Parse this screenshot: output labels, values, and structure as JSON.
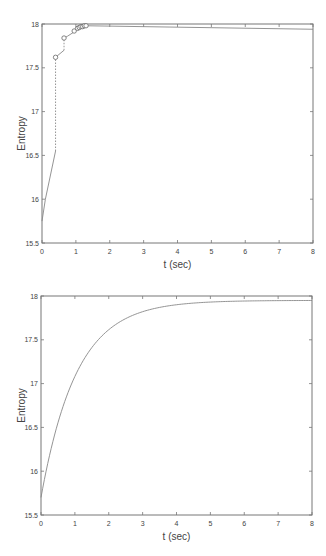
{
  "chart_data": [
    {
      "type": "line",
      "title": "",
      "xlabel": "t (sec)",
      "ylabel": "Entropy",
      "xlim": [
        0,
        8
      ],
      "ylim": [
        15.5,
        18
      ],
      "xticks": [
        "0",
        "1",
        "2",
        "3",
        "4",
        "5",
        "6",
        "7",
        "8"
      ],
      "yticks": [
        "15.5",
        "16",
        "16.5",
        "17",
        "17.5",
        "18"
      ],
      "grid": false,
      "series": [
        {
          "name": "discrete/step entropy trajectory",
          "x": [
            0,
            0.1,
            0.4,
            0.4,
            0.65,
            0.65,
            0.75,
            0.95,
            0.95,
            1.05,
            1.1,
            1.15,
            1.2,
            1.25,
            1.3,
            8
          ],
          "y": [
            15.75,
            16.0,
            16.55,
            17.62,
            17.7,
            17.84,
            17.86,
            17.91,
            17.92,
            17.95,
            17.96,
            17.97,
            17.97,
            17.98,
            17.98,
            17.94
          ],
          "markers_x": [
            0.4,
            0.65,
            0.95,
            1.05,
            1.1,
            1.15,
            1.2,
            1.25,
            1.3
          ],
          "markers_y": [
            17.62,
            17.84,
            17.92,
            17.95,
            17.96,
            17.97,
            17.97,
            17.98,
            17.98
          ],
          "marker": "circle"
        }
      ]
    },
    {
      "type": "line",
      "title": "",
      "xlabel": "t (sec)",
      "ylabel": "Entropy",
      "xlim": [
        0,
        8
      ],
      "ylim": [
        15.5,
        18
      ],
      "xticks": [
        "0",
        "1",
        "2",
        "3",
        "4",
        "5",
        "6",
        "7",
        "8"
      ],
      "yticks": [
        "15.5",
        "16",
        "16.5",
        "17",
        "17.5",
        "18"
      ],
      "grid": false,
      "series": [
        {
          "name": "continuous entropy trajectory",
          "x": [
            0,
            0.25,
            0.5,
            0.75,
            1,
            1.5,
            2,
            2.5,
            3,
            3.5,
            4,
            5,
            6,
            7,
            8
          ],
          "y": [
            15.7,
            16.2,
            16.62,
            16.95,
            17.2,
            17.52,
            17.7,
            17.8,
            17.86,
            17.9,
            17.92,
            17.94,
            17.95,
            17.95,
            17.95
          ]
        }
      ]
    }
  ],
  "colors": {
    "axis": "#777777",
    "line": "#888888",
    "text": "#444444"
  }
}
